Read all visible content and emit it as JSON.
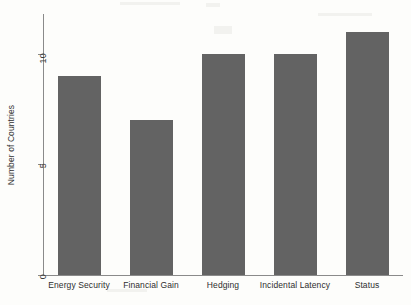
{
  "chart_data": {
    "type": "bar",
    "title": "",
    "subtitle": "",
    "xlabel": "",
    "ylabel": "Number of Countries",
    "categories": [
      "Energy Security",
      "Financial Gain",
      "Hedging",
      "Incidental Latency",
      "Status"
    ],
    "values": [
      9,
      7,
      10,
      10,
      11
    ],
    "ylim": [
      0,
      11.8
    ],
    "yticks": [
      0,
      5,
      10
    ],
    "ytick_labels": [
      "0",
      "5",
      "10"
    ],
    "grid": false,
    "legend": false,
    "legend_position": "none",
    "orientation": "vertical",
    "bar_color": "#636363",
    "axis_color": "#8a8a8a",
    "background_color": "#fdfdfb",
    "ytick_label_rotation": -90,
    "ylabel_rotation": -90
  }
}
